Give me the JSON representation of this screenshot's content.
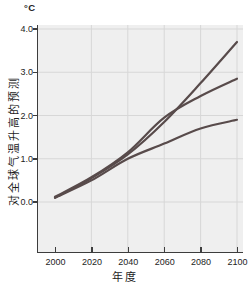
{
  "chart_data": {
    "type": "line",
    "unit_label": "°C",
    "xlabel": "年度",
    "ylabel": "对全球气温升高的预测",
    "x": [
      2000,
      2020,
      2040,
      2060,
      2080,
      2100
    ],
    "series": [
      {
        "name": "high-emission-projection",
        "values": [
          0.1,
          0.55,
          1.1,
          1.85,
          2.75,
          3.7
        ]
      },
      {
        "name": "mid-emission-projection",
        "values": [
          0.12,
          0.57,
          1.15,
          1.95,
          2.45,
          2.85
        ]
      },
      {
        "name": "low-emission-projection",
        "values": [
          0.1,
          0.5,
          1.0,
          1.35,
          1.7,
          1.9
        ]
      }
    ],
    "yticks": [
      0.0,
      1.0,
      2.0,
      3.0,
      4.0
    ],
    "ytick_labels": [
      "0.0",
      "1.0",
      "2.0",
      "3.0",
      "4.0"
    ],
    "xticks": [
      2000,
      2020,
      2040,
      2060,
      2080,
      2100
    ],
    "xtick_labels": [
      "2000",
      "2020",
      "2040",
      "2060",
      "2080",
      "2100"
    ],
    "ylim": [
      -1.16,
      4.09
    ],
    "xlim": [
      1990.7,
      2103.5
    ],
    "grid": true,
    "legend": "none",
    "line_color": "#584b4b",
    "plot_bg": "#efefef",
    "grid_color": "#d7d7d7",
    "axis_color": "#3d3d3d"
  }
}
